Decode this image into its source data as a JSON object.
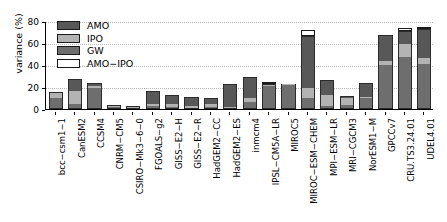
{
  "chart_data": {
    "type": "bar",
    "title": "",
    "subtitle": "",
    "xlabel": "",
    "ylabel": "variance (%)",
    "ylim": [
      0,
      80
    ],
    "yticks": [
      0,
      20,
      40,
      60,
      80
    ],
    "grid": true,
    "stacked": true,
    "legend_position": "top-left",
    "legend": [
      "AMO",
      "IPO",
      "GW",
      "AMO−IPO"
    ],
    "colors": {
      "AMO": "#585858",
      "IPO": "#b3b3b3",
      "GW": "#6e6e6e",
      "AMO-IPO": "#ffffff",
      "edge": "#1a1a1a",
      "gridline": "#b9b9b9"
    },
    "categories": [
      "bcc−csm1−1",
      "CanESM2",
      "CCSM4",
      "CNRM−CM5",
      "CSIRO−Mk3−6−0",
      "FGOALS−g2",
      "GISS−E2−H",
      "GISS−E2−R",
      "HadGEM2−CC",
      "HadGEM2−ES",
      "inmcm4",
      "IPSL−CM5A−LR",
      "MIROC5",
      "MIROC−ESM−CHEM",
      "MPI−ESM−LR",
      "MRI−CGCM3",
      "NorESM1−M",
      "GPCCv7",
      "CRU.TS3.24.01",
      "UDEL4.01"
    ],
    "series": [
      {
        "name": "GW",
        "values": [
          10,
          5,
          19,
          1.5,
          0.8,
          3,
          1.5,
          0.5,
          1.5,
          1,
          6,
          21,
          22,
          10,
          3,
          4,
          10,
          40,
          47,
          41
        ]
      },
      {
        "name": "IPO",
        "values": [
          5,
          11,
          2,
          1,
          0.7,
          2,
          3,
          2,
          3,
          1,
          4,
          1,
          0.5,
          9,
          10,
          6,
          1,
          4,
          12,
          5
        ]
      },
      {
        "name": "AMO",
        "values": [
          0.5,
          11,
          3,
          1.5,
          0.5,
          11.5,
          8,
          8.5,
          5.5,
          20.5,
          19,
          0.5,
          0,
          47,
          13,
          2,
          12.5,
          23,
          12,
          27
        ]
      },
      {
        "name": "AMO−IPO",
        "values": [
          0,
          0,
          0,
          0,
          0,
          0,
          0,
          0,
          0,
          0,
          0,
          1,
          0,
          6,
          0,
          0,
          0,
          0,
          3,
          1
        ]
      }
    ],
    "totals": [
      15.5,
      27,
      24,
      4,
      2,
      16.5,
      12.5,
      11,
      10,
      22.5,
      29,
      22.5,
      22.5,
      72,
      26,
      12,
      23.5,
      67,
      74,
      73
    ]
  }
}
